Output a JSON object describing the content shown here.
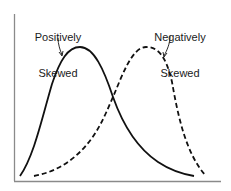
{
  "diagram": {
    "title": "",
    "labels": {
      "positive_line1": "Positively",
      "positive_line2": "Skewed",
      "negative_line1": "Negatively",
      "negative_line2": "Skewed"
    },
    "colors": {
      "axis": "#888888",
      "curve": "#111111",
      "background": "#ffffff"
    },
    "curves": [
      {
        "name": "Positively Skewed",
        "style": "solid",
        "peak_x": 80
      },
      {
        "name": "Negatively Skewed",
        "style": "dashed",
        "peak_x": 146
      }
    ]
  }
}
